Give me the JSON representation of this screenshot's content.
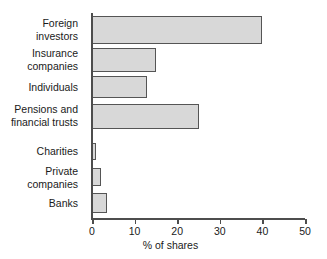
{
  "chart_data": {
    "type": "bar",
    "orientation": "horizontal",
    "title": "",
    "xlabel": "% of shares",
    "ylabel": "",
    "xlim": [
      0,
      50
    ],
    "xticks": [
      0,
      10,
      20,
      30,
      40,
      50
    ],
    "xtick_labels": [
      "0",
      "10",
      "20",
      "30",
      "40",
      "50"
    ],
    "grid": false,
    "legend": null,
    "categories": [
      "Foreign\ninvestors",
      "Insurance\ncompanies",
      "Individuals",
      "Pensions and\nfinancial trusts",
      "Charities",
      "Private\ncompanies",
      "Banks"
    ],
    "values": [
      40,
      15,
      13,
      25,
      1,
      2,
      3.5
    ],
    "bar_fill_color": "#d8d8d8",
    "bar_edge_color": "#555555",
    "axis_color": "#4d4d4d",
    "background_color": "#ffffff"
  },
  "bars": [
    {
      "label": "Foreign\ninvestors",
      "value": 40,
      "top": 16,
      "height": 28
    },
    {
      "label": "Insurance\ncompanies",
      "value": 15,
      "top": 48,
      "height": 24
    },
    {
      "label": "Individuals",
      "value": 13,
      "top": 76,
      "height": 22
    },
    {
      "label": "Pensions and\nfinancial trusts",
      "value": 25,
      "top": 104,
      "height": 25
    },
    {
      "label": "Charities",
      "value": 1,
      "top": 143,
      "height": 17
    },
    {
      "label": "Private\ncompanies",
      "value": 2,
      "top": 168,
      "height": 18
    },
    {
      "label": "Banks",
      "value": 3.5,
      "top": 193,
      "height": 20
    }
  ],
  "labels": [
    {
      "text": "Foreign\ninvestors",
      "top": 17
    },
    {
      "text": "Insurance\ncompanies",
      "top": 47
    },
    {
      "text": "Individuals",
      "top": 81
    },
    {
      "text": "Pensions and\nfinancial trusts",
      "top": 103
    },
    {
      "text": "Charities",
      "top": 145
    },
    {
      "text": "Private\ncompanies",
      "top": 165
    },
    {
      "text": "Banks",
      "top": 197
    }
  ]
}
